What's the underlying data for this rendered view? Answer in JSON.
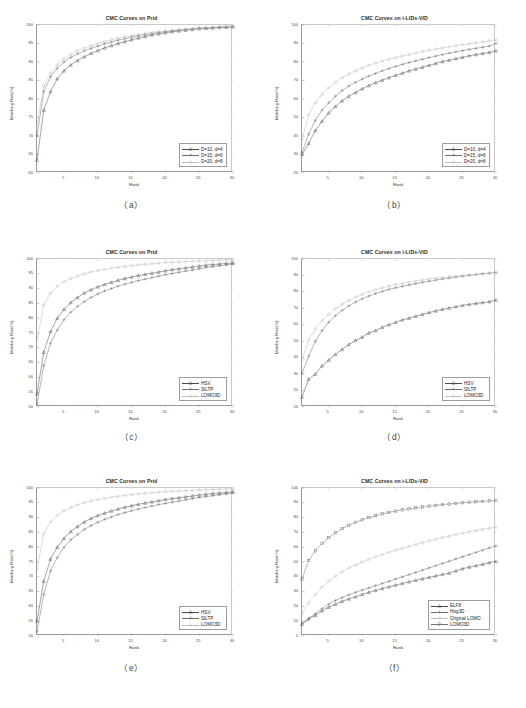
{
  "figure": {
    "captions": [
      "（a）",
      "（b）",
      "（c）",
      "（d）",
      "（e）",
      "（f）"
    ]
  },
  "axis_common": {
    "xlabel": "Rank",
    "ylabel": "Matching Rate(%)",
    "xticks": [
      "5",
      "10",
      "15",
      "20",
      "25",
      "30"
    ],
    "xlim": [
      1,
      30
    ]
  },
  "colors": {
    "series1": "#4a4a4a",
    "series2": "#6e6e6e",
    "series3": "#bdbdbd",
    "series4": "#707070",
    "axis": "#9a9a9a",
    "text": "#2b2b2b"
  },
  "chart_data": [
    {
      "id": "a",
      "type": "line",
      "title": "CMC Curves on Prid",
      "xlabel": "Rank",
      "ylabel": "Matching Rate(%)",
      "xlim": [
        1,
        30
      ],
      "ylim": [
        60,
        100
      ],
      "xticks": [
        5,
        10,
        15,
        20,
        25,
        30
      ],
      "yticks": [
        60,
        65,
        70,
        75,
        80,
        85,
        90,
        95,
        100
      ],
      "grid": false,
      "legend_position": "lower right",
      "x": [
        1,
        2,
        3,
        4,
        5,
        6,
        7,
        8,
        9,
        10,
        11,
        12,
        13,
        14,
        15,
        16,
        17,
        18,
        19,
        20,
        21,
        22,
        23,
        24,
        25,
        26,
        27,
        28,
        29,
        30
      ],
      "series": [
        {
          "name": "D=10, d=4",
          "marker": "triangle",
          "values": [
            63.5,
            77.0,
            82.0,
            85.5,
            87.6,
            89.2,
            90.4,
            91.4,
            92.3,
            93.1,
            93.8,
            94.4,
            95.0,
            95.5,
            96.0,
            96.5,
            96.9,
            97.3,
            97.6,
            97.9,
            98.2,
            98.4,
            98.6,
            98.8,
            99.0,
            99.1,
            99.2,
            99.3,
            99.4,
            99.5
          ]
        },
        {
          "name": "D=15, d=6",
          "marker": "plus",
          "values": [
            70.0,
            82.0,
            86.0,
            88.3,
            90.0,
            91.2,
            92.2,
            93.0,
            93.7,
            94.3,
            94.9,
            95.4,
            95.9,
            96.3,
            96.7,
            97.1,
            97.4,
            97.7,
            98.0,
            98.2,
            98.4,
            98.6,
            98.8,
            99.0,
            99.1,
            99.2,
            99.3,
            99.4,
            99.5,
            99.6
          ]
        },
        {
          "name": "D=20, d=8",
          "marker": "circle",
          "values": [
            73.0,
            83.5,
            87.0,
            89.2,
            90.8,
            92.0,
            93.0,
            93.8,
            94.4,
            95.0,
            95.5,
            96.0,
            96.4,
            96.8,
            97.1,
            97.4,
            97.7,
            98.0,
            98.2,
            98.4,
            98.6,
            98.8,
            98.9,
            99.0,
            99.2,
            99.3,
            99.4,
            99.5,
            99.6,
            99.7
          ]
        }
      ]
    },
    {
      "id": "b",
      "type": "line",
      "title": "CMC Curves on i-LIDs-VID",
      "xlabel": "Rank",
      "ylabel": "Matching Rate(%)",
      "xlim": [
        1,
        30
      ],
      "ylim": [
        20,
        100
      ],
      "xticks": [
        5,
        10,
        15,
        20,
        25,
        30
      ],
      "yticks": [
        20,
        30,
        40,
        50,
        60,
        70,
        80,
        90,
        100
      ],
      "grid": false,
      "legend_position": "lower right",
      "x": [
        1,
        2,
        3,
        4,
        5,
        6,
        7,
        8,
        9,
        10,
        11,
        12,
        13,
        14,
        15,
        16,
        17,
        18,
        19,
        20,
        21,
        22,
        23,
        24,
        25,
        26,
        27,
        28,
        29,
        30
      ],
      "series": [
        {
          "name": "D=10, d=4",
          "marker": "triangle",
          "values": [
            30.0,
            36.0,
            43.0,
            48.0,
            52.5,
            56.0,
            59.0,
            61.5,
            63.5,
            65.5,
            67.2,
            68.8,
            70.2,
            71.5,
            72.8,
            74.0,
            75.2,
            76.2,
            77.2,
            78.2,
            79.2,
            80.2,
            81.0,
            81.8,
            82.6,
            83.4,
            84.0,
            84.6,
            85.2,
            86.0
          ]
        },
        {
          "name": "D=15, d=6",
          "marker": "plus",
          "values": [
            31.0,
            41.0,
            48.5,
            54.0,
            58.0,
            61.5,
            64.5,
            67.0,
            69.0,
            70.8,
            72.4,
            73.8,
            75.2,
            76.4,
            77.6,
            78.7,
            79.7,
            80.6,
            81.5,
            82.4,
            83.2,
            84.0,
            84.8,
            85.5,
            86.2,
            86.8,
            87.4,
            88.0,
            88.6,
            90.0
          ]
        },
        {
          "name": "D=20, d=8",
          "marker": "circle",
          "values": [
            38.0,
            51.5,
            58.0,
            62.5,
            66.0,
            69.0,
            71.5,
            73.5,
            75.2,
            76.8,
            78.2,
            79.4,
            80.5,
            81.5,
            82.4,
            83.3,
            84.1,
            84.9,
            85.6,
            86.3,
            87.0,
            87.6,
            88.2,
            88.8,
            89.3,
            89.8,
            90.3,
            90.8,
            91.5,
            91.8
          ]
        }
      ]
    },
    {
      "id": "c",
      "type": "line",
      "title": "CMC Curves on Prid",
      "xlabel": "Rank",
      "ylabel": "Matching Rate(%)",
      "xlim": [
        1,
        30
      ],
      "ylim": [
        50,
        100
      ],
      "xticks": [
        5,
        10,
        15,
        20,
        25,
        30
      ],
      "yticks": [
        50,
        55,
        60,
        65,
        70,
        75,
        80,
        85,
        90,
        95,
        100
      ],
      "grid": false,
      "legend_position": "lower right",
      "x": [
        1,
        2,
        3,
        4,
        5,
        6,
        7,
        8,
        9,
        10,
        11,
        12,
        13,
        14,
        15,
        16,
        17,
        18,
        19,
        20,
        21,
        22,
        23,
        24,
        25,
        26,
        27,
        28,
        29,
        30
      ],
      "series": [
        {
          "name": "HSV",
          "marker": "triangle",
          "values": [
            54.5,
            68.5,
            75.5,
            80.0,
            83.0,
            85.3,
            87.0,
            88.5,
            89.6,
            90.6,
            91.4,
            92.1,
            92.8,
            93.4,
            93.9,
            94.4,
            94.8,
            95.2,
            95.6,
            96.0,
            96.4,
            96.7,
            97.0,
            97.3,
            97.6,
            97.9,
            98.1,
            98.3,
            98.5,
            98.7
          ]
        },
        {
          "name": "SILTP",
          "marker": "plus",
          "values": [
            51.0,
            64.0,
            71.5,
            76.0,
            79.5,
            82.0,
            84.0,
            85.6,
            87.0,
            88.2,
            89.2,
            90.0,
            90.8,
            91.5,
            92.1,
            92.7,
            93.2,
            93.7,
            94.2,
            94.7,
            95.1,
            95.5,
            95.9,
            96.3,
            96.7,
            97.1,
            97.4,
            97.7,
            98.0,
            98.3
          ]
        },
        {
          "name": "LOMO3D",
          "marker": "circle",
          "values": [
            72.5,
            84.5,
            88.5,
            90.8,
            92.3,
            93.4,
            94.3,
            95.0,
            95.6,
            96.1,
            96.5,
            96.9,
            97.2,
            97.5,
            97.8,
            98.0,
            98.2,
            98.4,
            98.6,
            98.8,
            98.9,
            99.0,
            99.1,
            99.2,
            99.3,
            99.4,
            99.5,
            99.6,
            99.7,
            99.8
          ]
        }
      ]
    },
    {
      "id": "d",
      "type": "line",
      "title": "CMC Curves on i-LIDs-VID",
      "xlabel": "Rank",
      "ylabel": "Matching Rate(%)",
      "xlim": [
        1,
        30
      ],
      "ylim": [
        10,
        100
      ],
      "xticks": [
        5,
        10,
        15,
        20,
        25,
        30
      ],
      "yticks": [
        10,
        20,
        30,
        40,
        50,
        60,
        70,
        80,
        90,
        100
      ],
      "grid": false,
      "legend_position": "lower right",
      "x": [
        1,
        2,
        3,
        4,
        5,
        6,
        7,
        8,
        9,
        10,
        11,
        12,
        13,
        14,
        15,
        16,
        17,
        18,
        19,
        20,
        21,
        22,
        23,
        24,
        25,
        26,
        27,
        28,
        29,
        30
      ],
      "series": [
        {
          "name": "HSV",
          "marker": "triangle",
          "values": [
            16.0,
            27.0,
            30.0,
            35.0,
            38.5,
            42.0,
            45.0,
            48.0,
            50.5,
            52.5,
            55.0,
            56.5,
            58.5,
            60.0,
            61.5,
            63.0,
            64.0,
            65.2,
            66.3,
            67.4,
            68.4,
            69.4,
            70.2,
            71.0,
            71.8,
            72.4,
            73.0,
            73.5,
            74.0,
            75.0
          ]
        },
        {
          "name": "SILTP",
          "marker": "plus",
          "values": [
            30.5,
            41.0,
            50.0,
            56.5,
            61.5,
            65.5,
            68.8,
            71.5,
            73.8,
            75.8,
            77.5,
            79.0,
            80.3,
            81.5,
            82.5,
            83.4,
            84.2,
            85.0,
            85.8,
            86.5,
            87.2,
            87.8,
            88.4,
            89.0,
            89.5,
            90.0,
            90.5,
            91.0,
            91.4,
            91.8
          ]
        },
        {
          "name": "LOMO3D",
          "marker": "circle",
          "values": [
            38.5,
            51.0,
            57.5,
            62.5,
            66.5,
            69.8,
            72.5,
            74.8,
            76.8,
            78.5,
            80.0,
            81.3,
            82.5,
            83.5,
            84.4,
            85.2,
            85.9,
            86.6,
            87.2,
            87.8,
            88.3,
            88.8,
            89.2,
            89.6,
            90.0,
            90.4,
            90.7,
            91.0,
            91.3,
            91.6
          ]
        }
      ]
    },
    {
      "id": "e",
      "type": "line",
      "title": "CMC Curves on Prid",
      "xlabel": "Rank",
      "ylabel": "Matching Rate(%)",
      "xlim": [
        1,
        30
      ],
      "ylim": [
        50,
        100
      ],
      "xticks": [
        5,
        10,
        15,
        20,
        25,
        30
      ],
      "yticks": [
        50,
        55,
        60,
        65,
        70,
        75,
        80,
        85,
        90,
        95,
        100
      ],
      "grid": false,
      "legend_position": "lower right",
      "x": [
        1,
        2,
        3,
        4,
        5,
        6,
        7,
        8,
        9,
        10,
        11,
        12,
        13,
        14,
        15,
        16,
        17,
        18,
        19,
        20,
        21,
        22,
        23,
        24,
        25,
        26,
        27,
        28,
        29,
        30
      ],
      "series": [
        {
          "name": "HSV",
          "marker": "triangle",
          "values": [
            55.0,
            68.5,
            76.0,
            80.0,
            83.0,
            85.3,
            87.0,
            88.5,
            89.7,
            90.7,
            91.5,
            92.2,
            92.9,
            93.5,
            94.0,
            94.5,
            94.9,
            95.3,
            95.7,
            96.1,
            96.4,
            96.7,
            97.0,
            97.3,
            97.6,
            97.9,
            98.1,
            98.3,
            98.5,
            98.7
          ]
        },
        {
          "name": "SILTP",
          "marker": "plus",
          "values": [
            51.5,
            64.0,
            72.0,
            76.5,
            80.0,
            82.5,
            84.3,
            86.0,
            87.3,
            88.4,
            89.4,
            90.2,
            91.0,
            91.7,
            92.3,
            92.9,
            93.4,
            93.9,
            94.4,
            94.8,
            95.2,
            95.6,
            96.0,
            96.4,
            96.8,
            97.1,
            97.4,
            97.7,
            98.0,
            98.3
          ]
        },
        {
          "name": "LOMO3D",
          "marker": "circle",
          "values": [
            72.5,
            84.5,
            88.5,
            90.8,
            92.3,
            93.4,
            94.3,
            95.0,
            95.6,
            96.1,
            96.5,
            96.9,
            97.2,
            97.5,
            97.8,
            98.0,
            98.2,
            98.4,
            98.6,
            98.8,
            98.9,
            99.0,
            99.1,
            99.2,
            99.3,
            99.4,
            99.5,
            99.6,
            99.7,
            99.8
          ]
        }
      ]
    },
    {
      "id": "f",
      "type": "line",
      "title": "CMC Curves on i-LIDs-VID",
      "xlabel": "Rank",
      "ylabel": "Matching Rate(%)",
      "xlim": [
        1,
        30
      ],
      "ylim": [
        0,
        100
      ],
      "xticks": [
        5,
        10,
        15,
        20,
        25,
        30
      ],
      "yticks": [
        0,
        10,
        20,
        30,
        40,
        50,
        60,
        70,
        80,
        90,
        100
      ],
      "grid": false,
      "legend_position": "lower right",
      "x": [
        1,
        2,
        3,
        4,
        5,
        6,
        7,
        8,
        9,
        10,
        11,
        12,
        13,
        14,
        15,
        16,
        17,
        18,
        19,
        20,
        21,
        22,
        23,
        24,
        25,
        26,
        27,
        28,
        29,
        30
      ],
      "series": [
        {
          "name": "ELF8",
          "marker": "triangle",
          "values": [
            8.0,
            11.5,
            14.0,
            17.0,
            19.5,
            21.5,
            23.5,
            25.0,
            26.5,
            28.0,
            29.5,
            30.8,
            32.0,
            33.2,
            34.4,
            35.5,
            36.6,
            37.6,
            38.6,
            39.6,
            40.6,
            41.6,
            42.5,
            44.0,
            45.5,
            46.5,
            47.5,
            48.5,
            49.5,
            50.5
          ]
        },
        {
          "name": "Hog3D",
          "marker": "plus",
          "values": [
            8.5,
            12.0,
            15.0,
            18.5,
            21.5,
            24.0,
            26.0,
            27.8,
            29.5,
            31.0,
            32.5,
            34.0,
            35.5,
            37.0,
            38.5,
            40.0,
            41.5,
            43.0,
            44.5,
            46.0,
            47.5,
            49.0,
            50.5,
            52.0,
            53.5,
            55.0,
            56.5,
            58.0,
            59.5,
            61.0
          ]
        },
        {
          "name": "Original LOMO",
          "marker": "circle",
          "values": [
            15.0,
            22.5,
            28.0,
            33.0,
            37.0,
            40.5,
            43.5,
            46.0,
            48.0,
            50.0,
            51.8,
            53.5,
            55.0,
            56.5,
            58.0,
            59.3,
            60.6,
            61.8,
            63.0,
            64.2,
            65.4,
            66.5,
            67.5,
            68.5,
            69.5,
            70.4,
            71.2,
            72.0,
            72.8,
            73.5
          ]
        },
        {
          "name": "LOMO3D",
          "marker": "square",
          "values": [
            38.5,
            51.0,
            57.5,
            62.5,
            66.5,
            69.8,
            72.5,
            74.8,
            76.8,
            78.5,
            80.0,
            81.3,
            82.5,
            83.5,
            84.4,
            85.2,
            85.9,
            86.6,
            87.2,
            87.8,
            88.3,
            88.8,
            89.2,
            89.6,
            90.0,
            90.4,
            90.7,
            91.0,
            91.3,
            91.6
          ]
        }
      ]
    }
  ]
}
